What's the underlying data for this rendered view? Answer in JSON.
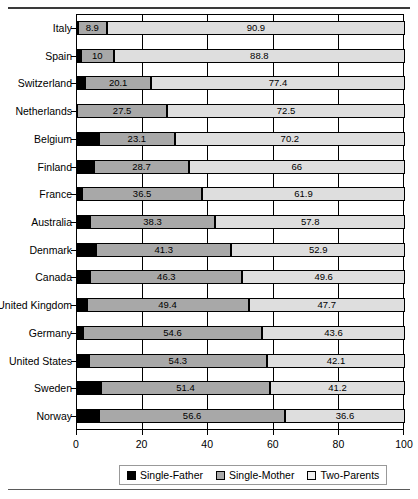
{
  "chart_data": {
    "type": "bar",
    "orientation": "horizontal",
    "stacked": true,
    "title": "",
    "xlabel": "",
    "ylabel": "",
    "xlim": [
      0,
      100
    ],
    "xticks": [
      0,
      20,
      40,
      60,
      80,
      100
    ],
    "grid": true,
    "legend_position": "bottom",
    "categories": [
      "Italy",
      "Spain",
      "Switzerland",
      "Netherlands",
      "Belgium",
      "Finland",
      "France",
      "Australia",
      "Denmark",
      "Canada",
      "United Kingdom",
      "Germany",
      "United States",
      "Sweden",
      "Norway"
    ],
    "series": [
      {
        "name": "Single-Father",
        "color": "#000000",
        "values": [
          0.2,
          1.2,
          2.5,
          0.0,
          6.7,
          5.3,
          1.6,
          3.9,
          5.8,
          4.1,
          2.9,
          1.8,
          3.6,
          7.4,
          6.8
        ],
        "labels_shown": false
      },
      {
        "name": "Single-Mother",
        "color": "#a8a8a8",
        "values": [
          8.9,
          10,
          20.1,
          27.5,
          23.1,
          28.7,
          36.5,
          38.3,
          41.3,
          46.3,
          49.4,
          54.6,
          54.3,
          51.4,
          56.6
        ],
        "labels": [
          "8.9",
          "10",
          "20.1",
          "27.5",
          "23.1",
          "28.7",
          "36.5",
          "38.3",
          "41.3",
          "46.3",
          "49.4",
          "54.6",
          "54.3",
          "51.4",
          "56.6"
        ],
        "labels_shown": true
      },
      {
        "name": "Two-Parents",
        "color": "#dedede",
        "values": [
          90.9,
          88.8,
          77.4,
          72.5,
          70.2,
          66,
          61.9,
          57.8,
          52.9,
          49.6,
          47.7,
          43.6,
          42.1,
          41.2,
          36.6
        ],
        "labels": [
          "90.9",
          "88.8",
          "77.4",
          "72.5",
          "70.2",
          "66",
          "61.9",
          "57.8",
          "52.9",
          "49.6",
          "47.7",
          "43.6",
          "42.1",
          "41.2",
          "36.6"
        ],
        "labels_shown": true
      }
    ]
  },
  "legend": {
    "items": [
      {
        "label": "Single-Father"
      },
      {
        "label": "Single-Mother"
      },
      {
        "label": "Two-Parents"
      }
    ]
  }
}
